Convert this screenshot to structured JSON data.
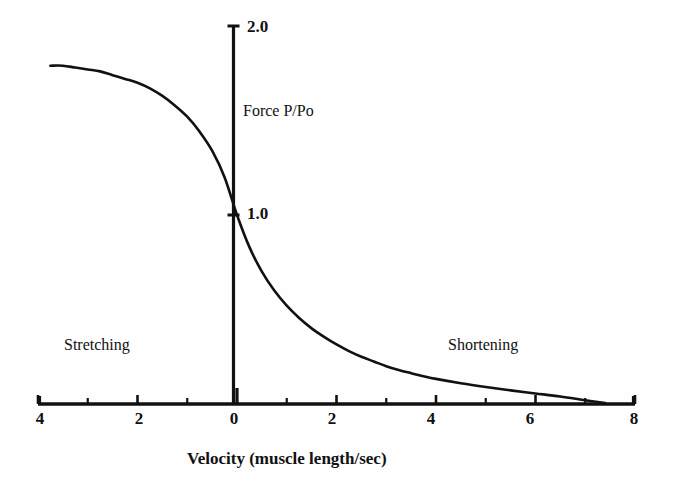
{
  "chart_data": {
    "type": "line",
    "title": "",
    "subtitle": "",
    "xlabel": "Velocity (muscle length/sec)",
    "ylabel": "Force  P/Po",
    "xlim": [
      -4,
      8
    ],
    "ylim": [
      0,
      2.0
    ],
    "grid": false,
    "legend": null,
    "x_tick_labels": [
      "4",
      "2",
      "0",
      "2",
      "4",
      "6",
      "8"
    ],
    "x_tick_values": [
      -4,
      -2,
      0,
      2,
      4,
      6,
      8
    ],
    "x_minor_tick_values": [
      -3,
      -1,
      1,
      3,
      5,
      7
    ],
    "y_tick_labels": [
      "1.0",
      "2.0"
    ],
    "y_tick_values": [
      1.0,
      2.0
    ],
    "annotations": [
      {
        "text": "Stretching",
        "x": -2.6,
        "y": 0.36
      },
      {
        "text": "Shortening",
        "x": 4.1,
        "y": 0.36
      },
      {
        "text": "Force  P/Po",
        "x": 0.35,
        "y": 1.52
      }
    ],
    "series": [
      {
        "name": "Force-velocity (Hill) curve",
        "x": [
          -3.75,
          -3.5,
          -3.25,
          -3.0,
          -2.75,
          -2.5,
          -2.25,
          -2.0,
          -1.75,
          -1.5,
          -1.25,
          -1.0,
          -0.75,
          -0.5,
          -0.25,
          0.0,
          0.25,
          0.5,
          0.75,
          1.0,
          1.25,
          1.5,
          1.75,
          2.0,
          2.25,
          2.5,
          2.75,
          3.0,
          3.25,
          3.5,
          3.75,
          4.0,
          4.5,
          5.0,
          5.5,
          6.0,
          6.5,
          7.0,
          7.4
        ],
        "y": [
          1.79,
          1.79,
          1.78,
          1.77,
          1.76,
          1.74,
          1.72,
          1.7,
          1.67,
          1.63,
          1.58,
          1.52,
          1.44,
          1.34,
          1.2,
          1.0,
          0.83,
          0.7,
          0.6,
          0.52,
          0.455,
          0.4,
          0.355,
          0.315,
          0.28,
          0.25,
          0.225,
          0.2,
          0.18,
          0.163,
          0.147,
          0.133,
          0.11,
          0.09,
          0.072,
          0.056,
          0.04,
          0.02,
          0.005
        ]
      }
    ]
  },
  "axes": {
    "x_ticks": [
      {
        "label": "4",
        "value": -4
      },
      {
        "label": "2",
        "value": -2
      },
      {
        "label": "0",
        "value": 0
      },
      {
        "label": "2",
        "value": 2
      },
      {
        "label": "4",
        "value": 4
      },
      {
        "label": "6",
        "value": 6
      },
      {
        "label": "8",
        "value": 8
      }
    ],
    "y_ticks": [
      {
        "label": "1.0",
        "value": 1.0
      },
      {
        "label": "2.0",
        "value": 2.0
      }
    ],
    "x_axis_title": "Velocity (muscle length/sec)",
    "y_axis_caption": "Force  P/Po"
  },
  "regions": {
    "left_label": "Stretching",
    "right_label": "Shortening"
  },
  "style": {
    "curve_color": "#111111",
    "axis_color": "#111111",
    "background_color": "#fefefe"
  }
}
